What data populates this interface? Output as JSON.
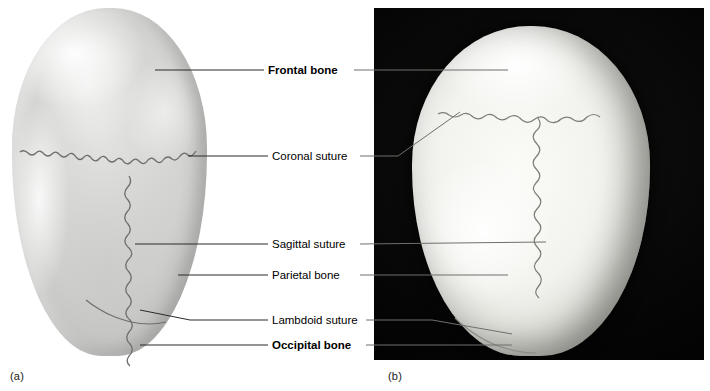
{
  "figure": {
    "panels": [
      {
        "id": "a",
        "caption": "(a)",
        "kind": "illustration",
        "description": "Superior view of skull, line drawing"
      },
      {
        "id": "b",
        "caption": "(b)",
        "kind": "photograph",
        "description": "Superior view of skull, photograph on black background"
      }
    ]
  },
  "labels": [
    {
      "key": "frontal_bone",
      "text": "Frontal bone",
      "bold": true,
      "x": 268,
      "y": 64
    },
    {
      "key": "coronal_suture",
      "text": "Coronal suture",
      "bold": false,
      "x": 272,
      "y": 150
    },
    {
      "key": "sagittal_suture",
      "text": "Sagittal suture",
      "bold": false,
      "x": 272,
      "y": 238
    },
    {
      "key": "parietal_bone",
      "text": "Parietal bone",
      "bold": false,
      "x": 272,
      "y": 269
    },
    {
      "key": "lambdoid_suture",
      "text": "Lambdoid suture",
      "bold": false,
      "x": 272,
      "y": 315
    },
    {
      "key": "occipital_bone",
      "text": "Occipital bone",
      "bold": true,
      "x": 272,
      "y": 339
    }
  ],
  "colors": {
    "background": "#ffffff",
    "text": "#000000",
    "leader": "#2a2a2a",
    "leader_light": "#8a8a8a",
    "photo_backdrop": "#050505",
    "bone_light": "#f2f2ee",
    "bone_mid": "#d2d2d0",
    "bone_shadow": "#a9a9a7"
  }
}
